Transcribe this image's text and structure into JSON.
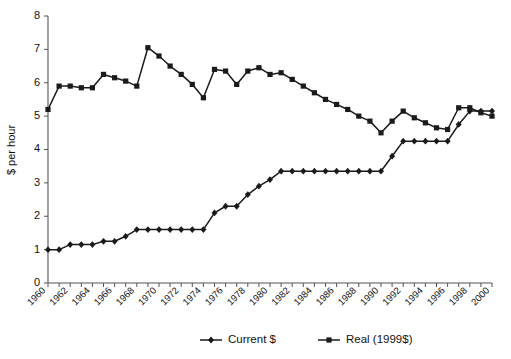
{
  "chart_data": {
    "type": "line",
    "title": "",
    "xlabel": "",
    "ylabel": "$ per hour",
    "ylim": [
      0,
      8
    ],
    "xlim": [
      1960,
      2000
    ],
    "y_ticks": [
      0,
      1,
      2,
      3,
      4,
      5,
      6,
      7,
      8
    ],
    "grid": false,
    "legend_position": "bottom",
    "x": [
      1960,
      1961,
      1962,
      1963,
      1964,
      1965,
      1966,
      1967,
      1968,
      1969,
      1970,
      1971,
      1972,
      1973,
      1974,
      1975,
      1976,
      1977,
      1978,
      1979,
      1980,
      1981,
      1982,
      1983,
      1984,
      1985,
      1986,
      1987,
      1988,
      1989,
      1990,
      1991,
      1992,
      1993,
      1994,
      1995,
      1996,
      1997,
      1998,
      1999,
      2000
    ],
    "x_tick_labels": [
      "1960",
      "1962",
      "1964",
      "1966",
      "1968",
      "1970",
      "1972",
      "1974",
      "1976",
      "1978",
      "1980",
      "1982",
      "1984",
      "1986",
      "1988",
      "1990",
      "1992",
      "1994",
      "1996",
      "1998",
      "2000"
    ],
    "series": [
      {
        "name": "Current $",
        "marker": "diamond",
        "values": [
          1.0,
          1.0,
          1.15,
          1.15,
          1.15,
          1.25,
          1.25,
          1.4,
          1.6,
          1.6,
          1.6,
          1.6,
          1.6,
          1.6,
          1.6,
          2.1,
          2.3,
          2.3,
          2.65,
          2.9,
          3.1,
          3.35,
          3.35,
          3.35,
          3.35,
          3.35,
          3.35,
          3.35,
          3.35,
          3.35,
          3.35,
          3.8,
          4.25,
          4.25,
          4.25,
          4.25,
          4.25,
          4.75,
          5.15,
          5.15,
          5.15
        ]
      },
      {
        "name": "Real (1999$)",
        "marker": "square",
        "values": [
          5.2,
          5.9,
          5.9,
          5.85,
          5.85,
          6.25,
          6.15,
          6.05,
          5.9,
          7.05,
          6.8,
          6.5,
          6.25,
          5.95,
          5.55,
          6.4,
          6.35,
          5.95,
          6.35,
          6.45,
          6.25,
          6.3,
          6.1,
          5.9,
          5.7,
          5.5,
          5.35,
          5.2,
          5.0,
          4.85,
          4.5,
          4.85,
          5.15,
          4.95,
          4.8,
          4.65,
          4.6,
          5.25,
          5.25,
          5.1,
          5.0
        ]
      }
    ],
    "legend": [
      {
        "label": "Current $",
        "marker": "diamond"
      },
      {
        "label": "Real (1999$)",
        "marker": "square"
      }
    ]
  },
  "colors": {
    "series": "#1a1a1a",
    "axis": "#555555",
    "background": "#ffffff",
    "text": "#111111"
  }
}
